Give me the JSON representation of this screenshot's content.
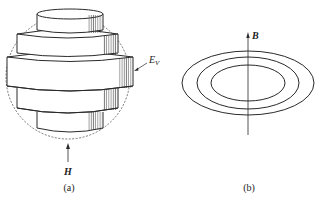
{
  "figure": {
    "panel_a": {
      "caption": "(a)",
      "field_label": "H",
      "energy_label_main": "E",
      "energy_label_sub": "V",
      "description": "Stacked cylindrical domain bands inside a dashed spherical outline"
    },
    "panel_b": {
      "caption": "(b)",
      "field_label": "B",
      "description": "Three concentric ellipses with a vertical B-field axis"
    },
    "colors": {
      "line": "#2a2a2a",
      "dashed_outline": "#555555",
      "background": "#ffffff"
    }
  }
}
